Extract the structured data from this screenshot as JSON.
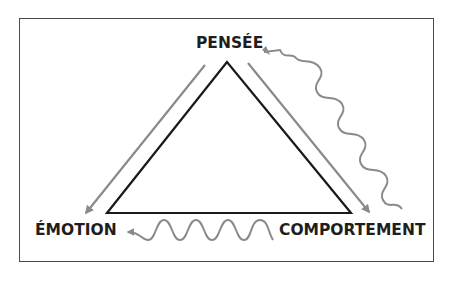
{
  "diagram": {
    "type": "cognitive-triangle",
    "nodes": {
      "top": "PENSÉE",
      "left": "ÉMOTION",
      "right": "COMPORTEMENT"
    },
    "edges": [
      {
        "from": "PENSÉE",
        "to": "ÉMOTION",
        "style": "straight-arrow"
      },
      {
        "from": "PENSÉE",
        "to": "COMPORTEMENT",
        "style": "straight-arrow"
      },
      {
        "from": "COMPORTEMENT",
        "to": "PENSÉE",
        "style": "wavy-arrow"
      },
      {
        "from": "COMPORTEMENT",
        "to": "ÉMOTION",
        "style": "wavy-arrow"
      }
    ],
    "colors": {
      "triangle": "#1a1a1a",
      "arrows": "#8a8a8a",
      "frame": "#4a4a4a",
      "text": "#1e1e1e"
    }
  }
}
